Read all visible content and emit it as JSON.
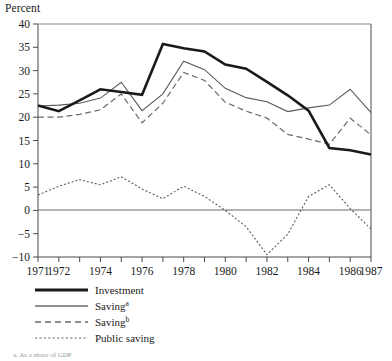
{
  "chart_data": {
    "type": "line",
    "title": "",
    "ylabel": "Percent",
    "xlabel": "",
    "ylim": [
      -10,
      40
    ],
    "xlim": [
      1971,
      1987
    ],
    "grid": false,
    "zero_line": true,
    "legend_position": "below-left",
    "ytick_labels": [
      "40",
      "35",
      "30",
      "25",
      "20",
      "15",
      "10",
      "5",
      "0",
      "-5",
      "-10"
    ],
    "ytick_values": [
      40,
      35,
      30,
      25,
      20,
      15,
      10,
      5,
      0,
      -5,
      -10
    ],
    "xtick_labels": [
      "1971",
      "1972",
      "1974",
      "1976",
      "1978",
      "1980",
      "1982",
      "1984",
      "1986",
      "1987"
    ],
    "xtick_values": [
      1971,
      1972,
      1974,
      1976,
      1978,
      1980,
      1982,
      1984,
      1986,
      1987
    ],
    "x": [
      1971,
      1972,
      1973,
      1974,
      1975,
      1976,
      1977,
      1978,
      1979,
      1980,
      1981,
      1982,
      1983,
      1984,
      1985,
      1986,
      1987
    ],
    "series": [
      {
        "name": "Investment",
        "style": "thick-solid",
        "values": [
          22.5,
          21.3,
          23.6,
          26.0,
          25.4,
          24.8,
          35.7,
          34.8,
          34.1,
          31.3,
          30.4,
          27.6,
          24.7,
          21.4,
          13.4,
          12.9,
          12.0
        ]
      },
      {
        "name": "Saving",
        "superscript": "a",
        "style": "thin-solid",
        "values": [
          22.4,
          22.6,
          23.0,
          24.1,
          27.5,
          21.4,
          25.0,
          32.0,
          30.2,
          26.2,
          24.2,
          23.3,
          21.2,
          22.0,
          22.6,
          26.0,
          21.0
        ]
      },
      {
        "name": "Saving",
        "superscript": "b",
        "style": "dashed",
        "values": [
          20.0,
          20.0,
          20.6,
          21.6,
          25.0,
          18.8,
          23.0,
          29.6,
          27.9,
          23.2,
          21.3,
          19.8,
          16.3,
          15.3,
          14.2,
          19.8,
          16.2
        ]
      },
      {
        "name": "Public saving",
        "style": "dotted",
        "values": [
          3.3,
          5.2,
          6.6,
          5.5,
          7.2,
          4.6,
          2.5,
          5.2,
          3.0,
          0.0,
          -3.5,
          -9.5,
          -5.1,
          3.0,
          5.5,
          0.4,
          -4.0
        ]
      }
    ]
  },
  "legend": {
    "items": [
      {
        "label": "Investment",
        "superscript": ""
      },
      {
        "label": "Saving",
        "superscript": "a"
      },
      {
        "label": "Saving",
        "superscript": "b"
      },
      {
        "label": "Public saving",
        "superscript": ""
      }
    ]
  },
  "footnote": {
    "text": "a. As a share of GDP"
  }
}
